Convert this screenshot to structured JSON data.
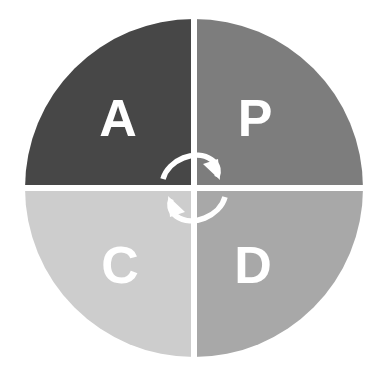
{
  "figure": {
    "shape": "circle-quadrants",
    "background_color": "#ffffff",
    "divider_color": "#ffffff",
    "label_color": "#ffffff",
    "arrow_color": "#ffffff",
    "center_x": 194,
    "center_y": 188,
    "radius": 169
  },
  "quadrants": [
    {
      "id": "act",
      "label": "A",
      "position": "top-left",
      "color": "#474747",
      "label_x": 118,
      "label_y": 118
    },
    {
      "id": "plan",
      "label": "P",
      "position": "top-right",
      "color": "#7d7d7d",
      "label_x": 255,
      "label_y": 118
    },
    {
      "id": "check",
      "label": "C",
      "position": "bottom-left",
      "color": "#cdcdcd",
      "label_x": 120,
      "label_y": 265
    },
    {
      "id": "do",
      "label": "D",
      "position": "bottom-right",
      "color": "#a8a8a8",
      "label_x": 253,
      "label_y": 265
    }
  ],
  "arrows": [
    {
      "id": "arrow-act-to-plan",
      "direction": "left-to-right",
      "color": "#ffffff"
    },
    {
      "id": "arrow-do-to-check",
      "direction": "right-to-left",
      "color": "#ffffff"
    }
  ]
}
